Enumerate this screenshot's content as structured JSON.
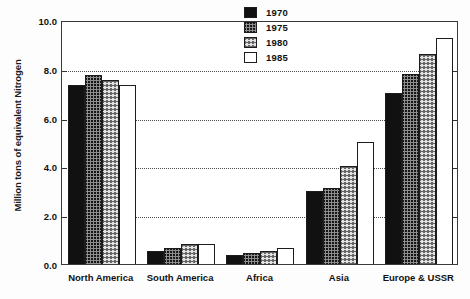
{
  "chart_data": {
    "type": "bar",
    "title": "",
    "subtitle": "",
    "xlabel": "",
    "ylabel": "Million tons of equivalent Nitrogen",
    "ylim": [
      0.0,
      10.0
    ],
    "ytick_labels": [
      "10.0",
      "8.0",
      "6.0",
      "4.0",
      "2.0",
      "0.0"
    ],
    "ytick_values": [
      10.0,
      8.0,
      6.0,
      4.0,
      2.0,
      0.0
    ],
    "grid": "horizontal-dotted",
    "gridline_values": [
      8.0,
      6.0,
      4.0,
      2.0
    ],
    "legend_position": "top-right",
    "categories": [
      "North America",
      "South America",
      "Africa",
      "Asia",
      "Europe & USSR"
    ],
    "series": [
      {
        "name": "1970",
        "pattern": "solid-black",
        "values": [
          7.35,
          0.55,
          0.35,
          3.0,
          7.0
        ]
      },
      {
        "name": "1975",
        "pattern": "dark-hatch",
        "values": [
          7.75,
          0.65,
          0.45,
          3.1,
          7.8
        ]
      },
      {
        "name": "1980",
        "pattern": "light-hatch",
        "values": [
          7.55,
          0.82,
          0.55,
          4.0,
          8.6
        ]
      },
      {
        "name": "1985",
        "pattern": "white-empty",
        "values": [
          7.35,
          0.82,
          0.65,
          5.0,
          9.25
        ]
      }
    ]
  },
  "legend": {
    "items": [
      {
        "label": "1970"
      },
      {
        "label": "1975"
      },
      {
        "label": "1980"
      },
      {
        "label": "1985"
      }
    ]
  },
  "colors": {
    "axis": "#3a3a3a",
    "grid": "#4a4a4a",
    "text": "#111111",
    "series_1970": "#111111",
    "series_1975": "#8e8e8e",
    "series_1980": "#e2e2e2",
    "series_1985": "#ffffff"
  }
}
